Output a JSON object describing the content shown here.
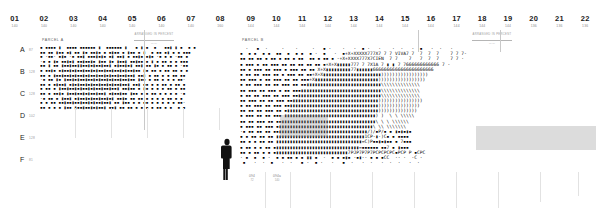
{
  "panel_a": {
    "parcel_label": "PARCEL A",
    "columns": [
      {
        "num": "01",
        "sub": "140"
      },
      {
        "num": "02",
        "sub": "140"
      },
      {
        "num": "03",
        "sub": "140"
      },
      {
        "num": "04",
        "sub": "140"
      },
      {
        "num": "05",
        "sub": "140"
      },
      {
        "num": "06",
        "sub": "140"
      },
      {
        "num": "07",
        "sub": "140"
      },
      {
        "num": "08",
        "sub": "160"
      }
    ],
    "rows": [
      {
        "letter": "A",
        "sub": "87"
      },
      {
        "letter": "B",
        "sub": "128"
      },
      {
        "letter": "C",
        "sub": "128"
      },
      {
        "letter": "D",
        "sub": "102"
      },
      {
        "letter": "E",
        "sub": "128"
      },
      {
        "letter": "F",
        "sub": "81"
      }
    ],
    "dimension_note": {
      "text": "ARRANGED IN PERCENT",
      "value": "— —"
    },
    "texture_rows": [
      "▪ ▪▪▪▪ ▮  ▪▪▪▪ ▪▪▪▪▪▪ ▮  ▪▪▪▪▪▪ ▮   ▪ ▮ ▪  ▪   ▪▪▮ ▮ ▪  ▪ ▪",
      "▪▪ ▪▪ ▮▪▪ ▪▮ ▪▪ ▮▪ ▪▪▮▪ ▪ ▪▮▪▪ ▪ ▮▪▪ ▪ ▮  ▪ ▪▪ ▪▮ ▪ ▪ ▪▪▪",
      "▪ ·▪▪· ▪▮▪ ·▪ ▪▪▮ ▪▪▪▮▪▮▪ ▪▮ ▪▪▮ ▪ ▪▪▮▪ ▪▮▪ ·▪ ▪ ▪ ·▪▪ ▪",
      "·▪ ▪ ▮▪ ▪▪▮▪▮ ▪▪▮▪▪▮▪ ▮▪▪ ▮▪ ▮▪▪▮ ▪▪▮▪▪ ▪ ▮ ▪ ▪▪ ▪ ▪ ▪▪▪",
      "▪▪ ▮ ▪▪ ▮▪▪▮▪▪▮▮▪▪▮▪▮▪▪▮▪▪▮ ▪▮▪▪▮▪▮ ▪▪▮ ▪▪ ▮▪ ▪ ▪▪ ▪ ·▪▪",
      "▪ ▪▪▮▪ ▪▮▪▪▮▪▮▪▪▮▪▪▮▪▮▪▪▮▪▪▮▪▪▮▪▮▪▪▮▪▪ ▮▪ ▪▪ ▪ ▪▪ ▪▪ ▪ ▪",
      "▪▪ ▪ ▮▪▪▮▪▪▮▪▮▪▪▮▪▮▪▪▮▪▪▮▪▮▪▪▮▪▪▮▪▪▮ ▪▪▮ ▪ ▪▪ ▪ ▪ ▪▪ ▪▪",
      "·▪ ▪▪ ▮▪ ▮▪▪▮▪▮▪▪▮▪▪▮▪▮▪▪▮▪▮▪▪▮▪▪▮▪▪ ▮▪▪ ▪ ▪▪ ▪ ▪ ▪ ▪▪·",
      "▪▪ ▪ ▪▮▪▪▮ ▪▮▪▮▪▪▮▪▮▪▪▮▪▪▮▪▮▪▪▮▪▪▮ ▪▪▮ ▪▪ ▪ ▪ ▪▪ ▪ ▪▪ ▪",
      "▪ ▪▪ ▪ ▮▪▪▮▪▪▮▪▮▪▪▮▪▮▪▪▮▪▪▮▪▪▮ ▪▪▮▪▪ ▪ ▮▪ ▪ ▪ ▪ ▪▪ ▪ ▪▪",
      "▪▪ ▪ ▪▪▮▪ ▮▪▪▮▪▪▮▪▮▪▪▮▪▪▮ ▪▮▪▪▮▪▪ ▮▪▪ ▪ ▪ ▪▪ ▪ ▪ ▪ ▪ ·▪",
      "·▪ ▪▪ ▪ ▮▪▪▮ ▪▮▪▪▮▪▮▪▪▮▪▪▮▪▮ ▪▪▮▪ ▪▪ ▪▪ ▪ ▪ ▪ ▪ ▪▪ ▪ ▪ ",
      "▪ ▪ ▪▪ ▪▪▮▪▪▮▪▪▮▪▪▮▪▮▪▪▮▪▪▮ ▪▪ ▮▪▪ ▪ ▪ ▪▪ ▪ ▪ ▪ ▪ ▪ ▪▪·",
      "▪▪ ▪ ▪ ▪ ▮▪▪ ▮▪▪▮▪▪▮▪▮▪▪▮ ▪▪▮ ▪▪ ▪▪ ▪ ▪ ▪ ▪ ▪▪ ▪ ▪  ▪ ▪"
    ]
  },
  "panel_b": {
    "parcel_label": "PARCEL B",
    "columns": [
      {
        "num": "09",
        "sub": "144"
      },
      {
        "num": "10",
        "sub": "144"
      },
      {
        "num": "11",
        "sub": "144"
      },
      {
        "num": "12",
        "sub": "144"
      },
      {
        "num": "13",
        "sub": "144"
      },
      {
        "num": "14",
        "sub": "144"
      },
      {
        "num": "15",
        "sub": "144"
      },
      {
        "num": "16",
        "sub": "144"
      },
      {
        "num": "17",
        "sub": "144"
      },
      {
        "num": "18",
        "sub": "144"
      },
      {
        "num": "19",
        "sub": "144"
      },
      {
        "num": "20",
        "sub": "136"
      },
      {
        "num": "21",
        "sub": "136"
      },
      {
        "num": "22",
        "sub": "136"
      }
    ],
    "dimension_note": {
      "text": "ARRANGED IN PERCENT",
      "value": "— —"
    },
    "texture_rows": [
      "  ·   ▪  ·     ·    ·     ·   ▪ ·    ·   ·  ▪ ·   ·    ·  ·   ·  ▪   ·  ·   ·",
      "▪  ▪ ▪  ▪ ▪  ▪▪  ▪  ▪ ▪  ▪ ·  ▪   ·  ▪+X+XXXXX777X7 7 7 VIVA7 7  7  7  7    7 7 7-",
      "▪▪ ▪▪ ▪▪ ▪ ▪▪ ▪ ▪▪ ▪ ▪▪  ▪▪ ▪ ▪▪ ▪ ·+X+XXXX777X7CIEN  7 7    7   7  7  7    7 7 ·",
      "▪ ▪▪▪ ▪ ▪▪ ▪▪▪ ▪▪ ▪▪ ▪▪ ▪▪ ▪▪ ▪+X+X▮▮▮▮▮777 7 7X1A 7 ▮ ▮ 7 7666666666666 7 ·",
      "▪▪ ▪ ▪▪▪ ▪▪ ▪▪▪ ▪ ▪▪▪ ▪▪ ▪▪ X+X▮▮▮▮▮▮▮▮▮77▮▮▮▮▮▮6666666666666666666666",
      "▪ ▪▪ ▪▪ ▪▪▪ ▪▪ ▪ ▪▪▪ ▪▪ ▪▪+X+X▮▮▮▮▮▮▮▮▮▮▮▮▮▮▮▮▮▮▮▮▮)))))))))))))))))",
      "▪▪ ▪▪▪ ▪ ▪▪ ▪▪▪ ▪▪ ▪▪ ▪▪▪+X▮▮▮▮▮▮▮▮▮▮▮▮▮▮▮▮▮▮▮▮▮▮▮)))))))))))))))))",
      "▪ ▪▪ ▪▪▪ ▪▪ ▪▪ ▪▪▪ ▪▪ ▪▪▮▮▮▮▮▮▮▮▮▮▮▮▮▮▮▮▮▮▮▮▮▮▮▮▮▮▮\\\\\\\\\\\\\\\\\\\\\\\\\\\\",
      "▪▪ ▪▪▪ ▪▪ ▪▪▪ ▪ ▪▪ ▪▪▪▮▮▮▮▮▮▮▮▮▮▮▮▮▮▮▮▮▮▮▮▮▮▮▮▮▮▮▮▮\\\\\\\\\\\\\\\\\\\\\\\\\\\\",
      "▪ ▪▪ ▪▪ ▪▪▪ ▪▪ ▪▪▪ ▪▪▮▮▮▮▮▮▮▮▮▮▮▮▮▮▮▮▮▮▮▮▮▮▮▮▮▮▮▮▮▮\\\\\\\\\\\\\\\\\\\\\\\\\\\\",
      "▪▪ ▪▪▪ ▪▪ ▪▪ ▪▪▪ ▪▪▮▮▮▮▮▮▮▮▮▮▮▮▮▮▮▮▮▮▮▮▮▮▮▮▮▮▮▮▮▮▮))))))))))))))))",
      "▪ ▪▪ ▪▪▪ ▪▪ ▪▪▪ ▪▪▮▮▮▮▮▮▮▮▮▮▮▮▮▮▮▮▮▮▮▮▮▮▮▮▮▮▮▮▮▮▮▮)))))))))))))))",
      "▪▪ ▪▪ ▪▪ ▪▪▪ ▪▪ ▪▮▮▮▮▮▮▮▮▮▮▮▮▮▮▮▮▮▮▮▮▮▮▮▮▮▮▮▮▮▮▮▮▮))))))))))))))",
      "▪ ▪▪▪ ▪▪ ▪▪ ▪▪▪ ▮▮▮▮▮▮▮▮▮▮▮▮▮▮▮▮▮▮▮▮▮▮▮▮▮▮▮▮▮▮▮▮▮) )  \\ \\ \\\\\\\\\\",
      "▪▪ ▪▪ ▪▪▪ ▪▪ ▪▪▮▮▮▮▮▮▮▮▮▮▮▮▮▮▮▮▮▮▮▮▮▮▮▮▮▮▮▮▮▮▮▮▮▮\\ \\ \\ \\\\\\\\\\\\",
      "▪ ▪▪▪ ▪▪ ▪▪▪ ▪▮▮▮▮▮▮▮▮▮▮▮▮▮▮▮▮▮▮▮▮▮▮▮▮▮▮▮▮▮▮▮▮▮▮\\ \\\\ \\\\\\\\\\\\\\",
      "·▪ ▪▪ ▪▪ ▪▪ ▪▪▮▮▮▮▮▮▮▮▮▮▮▮▮▮▮▮▮▮▮▮▮▮▮▮▮▮▮▮▮▮▮▮/)/▪P/▪ ▪ ▮▪▮▪▮▪",
      "▪ ▪ ▪▪ ▪▪ ▪▪ ▮▮▮▮▮▮▮▮▮▮▮▮▮▮▮▮▮▮▮▮▮▮▮▮▮▮▮▮▮▮▮▮1CP·▮·)C▪ ▪ ▪▪▪▪",
      "▪▪ ▪ ▪ ▪▪ ▪▪ ▮▮▮▮▮▮▮▮▮▮▮▮▮▮▮▮▮▮▮▮▮▮▮▮▮▮▮▮▮▮▮=C)P▪▪▮▪▮▪▪ ▪ 7▪▪▪",
      "▪ ▪▪ ▪ ▪ ▪▪ ▪▮▮▮▮▮▮▮▮▮▮▮▮▮▮▮▮▮▮▮▮▮▮▮▮▮▮▮▮▮▮=▪▪▪▪▪▪ ▪▪7 ▪ ▮▪▪▪",
      "▪▪ ▪ ▪▪ ▪ ▪ ▪▮▮▮▮▮▮▮▮▮▮▮▮▮▮▮▮▮▮▮▮▮▮▮▮▮▮7PJP7P7P7PCPCPCPC▪PCP P ▪CPC",
      "· ▪  ▪  ▪ ·  ▪ ▪ ▪▪ ▪ ▪ ▮▮ ▪  ·  ▪ ▪ ▪▮▪ ·▪▮·· ▪ ▪ ▪CC  ·· ·  ·C ·",
      " ▪   ·  ·  ▪   ·  ·   ▪ ·  ▪ ·   ·   ▪  ·   ·  ·   ·  ·  ·   ·  ·"
    ],
    "bottom_ticks": [
      {
        "name": "094",
        "value": "72"
      },
      {
        "name": "094a",
        "value": "140"
      }
    ]
  },
  "scale_figure": {
    "name": "human-scale-figure"
  }
}
